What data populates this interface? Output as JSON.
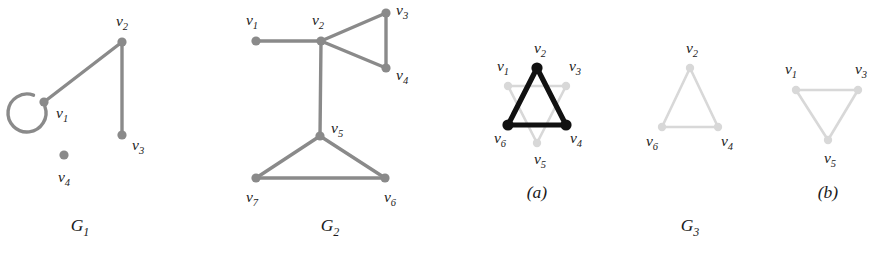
{
  "figure": {
    "width": 873,
    "height": 255,
    "background": "#ffffff",
    "colors": {
      "edge_gray": "#8a8a8a",
      "node_gray": "#8a8a8a",
      "edge_light": "#d8d8d8",
      "node_light": "#d8d8d8",
      "highlight_black": "#111111",
      "label_text": "#1a1a1a"
    }
  },
  "graphs": [
    {
      "id": "G1",
      "caption": "G",
      "caption_sub": "1",
      "caption_x": 80,
      "caption_y": 231,
      "vertices": [
        {
          "id": "v1",
          "name": "v",
          "sub": "1",
          "x": 44,
          "y": 102,
          "r": 4.6,
          "style": "gray",
          "label_x": 56,
          "label_y": 118,
          "label_anchor": "start"
        },
        {
          "id": "v2",
          "name": "v",
          "sub": "2",
          "x": 122,
          "y": 42,
          "r": 4.6,
          "style": "gray",
          "label_x": 122,
          "label_y": 26,
          "label_anchor": "middle"
        },
        {
          "id": "v3",
          "name": "v",
          "sub": "3",
          "x": 122,
          "y": 135,
          "r": 4.6,
          "style": "gray",
          "label_x": 132,
          "label_y": 150,
          "label_anchor": "start"
        },
        {
          "id": "v4",
          "name": "v",
          "sub": "4",
          "x": 64,
          "y": 155,
          "r": 4.6,
          "style": "gray",
          "label_x": 64,
          "label_y": 182,
          "label_anchor": "middle"
        }
      ],
      "edges": [
        {
          "from": "v1",
          "to": "v2",
          "style": "gray"
        },
        {
          "from": "v2",
          "to": "v3",
          "style": "gray"
        }
      ],
      "self_loops": [
        {
          "at": "v1",
          "cx": 27,
          "cy": 113,
          "r": 19,
          "style": "gray",
          "gap_start_deg": -70,
          "gap_end_deg": -20
        }
      ]
    },
    {
      "id": "G2",
      "caption": "G",
      "caption_sub": "2",
      "caption_x": 330,
      "caption_y": 231,
      "vertices": [
        {
          "id": "v1",
          "name": "v",
          "sub": "1",
          "x": 256,
          "y": 41,
          "r": 4.6,
          "style": "gray",
          "label_x": 252,
          "label_y": 25,
          "label_anchor": "middle"
        },
        {
          "id": "v2",
          "name": "v",
          "sub": "2",
          "x": 321,
          "y": 41,
          "r": 4.6,
          "style": "gray",
          "label_x": 318,
          "label_y": 25,
          "label_anchor": "middle"
        },
        {
          "id": "v3",
          "name": "v",
          "sub": "3",
          "x": 386,
          "y": 13,
          "r": 4.6,
          "style": "gray",
          "label_x": 396,
          "label_y": 15,
          "label_anchor": "start"
        },
        {
          "id": "v4",
          "name": "v",
          "sub": "4",
          "x": 386,
          "y": 68,
          "r": 4.6,
          "style": "gray",
          "label_x": 396,
          "label_y": 80,
          "label_anchor": "start"
        },
        {
          "id": "v5",
          "name": "v",
          "sub": "5",
          "x": 320,
          "y": 136,
          "r": 4.6,
          "style": "gray",
          "label_x": 331,
          "label_y": 133,
          "label_anchor": "start"
        },
        {
          "id": "v6",
          "name": "v",
          "sub": "6",
          "x": 385,
          "y": 178,
          "r": 4.6,
          "style": "gray",
          "label_x": 390,
          "label_y": 202,
          "label_anchor": "middle"
        },
        {
          "id": "v7",
          "name": "v",
          "sub": "7",
          "x": 256,
          "y": 178,
          "r": 4.6,
          "style": "gray",
          "label_x": 252,
          "label_y": 202,
          "label_anchor": "middle"
        }
      ],
      "edges": [
        {
          "from": "v1",
          "to": "v2",
          "style": "gray"
        },
        {
          "from": "v2",
          "to": "v3",
          "style": "gray"
        },
        {
          "from": "v2",
          "to": "v4",
          "style": "gray"
        },
        {
          "from": "v3",
          "to": "v4",
          "style": "gray"
        },
        {
          "from": "v2",
          "to": "v5",
          "style": "gray"
        },
        {
          "from": "v5",
          "to": "v6",
          "style": "gray"
        },
        {
          "from": "v5",
          "to": "v7",
          "style": "gray"
        },
        {
          "from": "v6",
          "to": "v7",
          "style": "gray"
        }
      ],
      "self_loops": []
    },
    {
      "id": "G3a",
      "caption": "(a)",
      "caption_sub": "",
      "caption_x": 537,
      "caption_y": 198,
      "vertices": [
        {
          "id": "v1",
          "name": "v",
          "sub": "1",
          "x": 508,
          "y": 86,
          "r": 4.2,
          "style": "light",
          "label_x": 503,
          "label_y": 71,
          "label_anchor": "middle"
        },
        {
          "id": "v2",
          "name": "v",
          "sub": "2",
          "x": 537,
          "y": 68,
          "r": 5.6,
          "style": "black",
          "label_x": 540,
          "label_y": 53,
          "label_anchor": "middle"
        },
        {
          "id": "v3",
          "name": "v",
          "sub": "3",
          "x": 566,
          "y": 86,
          "r": 4.2,
          "style": "light",
          "label_x": 575,
          "label_y": 71,
          "label_anchor": "middle"
        },
        {
          "id": "v4",
          "name": "v",
          "sub": "4",
          "x": 566,
          "y": 125,
          "r": 5.6,
          "style": "black",
          "label_x": 576,
          "label_y": 143,
          "label_anchor": "middle"
        },
        {
          "id": "v5",
          "name": "v",
          "sub": "5",
          "x": 537,
          "y": 143,
          "r": 4.2,
          "style": "light",
          "label_x": 540,
          "label_y": 164,
          "label_anchor": "middle"
        },
        {
          "id": "v6",
          "name": "v",
          "sub": "6",
          "x": 508,
          "y": 125,
          "r": 5.6,
          "style": "black",
          "label_x": 500,
          "label_y": 143,
          "label_anchor": "middle"
        }
      ],
      "edges": [
        {
          "from": "v1",
          "to": "v3",
          "style": "light"
        },
        {
          "from": "v3",
          "to": "v5",
          "style": "light"
        },
        {
          "from": "v5",
          "to": "v1",
          "style": "light"
        },
        {
          "from": "v2",
          "to": "v4",
          "style": "black"
        },
        {
          "from": "v4",
          "to": "v6",
          "style": "black"
        },
        {
          "from": "v6",
          "to": "v2",
          "style": "black"
        }
      ],
      "self_loops": []
    },
    {
      "id": "G3mid",
      "caption": "",
      "caption_sub": "",
      "caption_x": 0,
      "caption_y": 0,
      "vertices": [
        {
          "id": "v2",
          "name": "v",
          "sub": "2",
          "x": 690,
          "y": 68,
          "r": 4.2,
          "style": "light",
          "label_x": 692,
          "label_y": 53,
          "label_anchor": "middle"
        },
        {
          "id": "v4",
          "name": "v",
          "sub": "4",
          "x": 718,
          "y": 127,
          "r": 4.2,
          "style": "light",
          "label_x": 727,
          "label_y": 146,
          "label_anchor": "middle"
        },
        {
          "id": "v6",
          "name": "v",
          "sub": "6",
          "x": 662,
          "y": 127,
          "r": 4.2,
          "style": "light",
          "label_x": 652,
          "label_y": 146,
          "label_anchor": "middle"
        }
      ],
      "edges": [
        {
          "from": "v2",
          "to": "v4",
          "style": "light"
        },
        {
          "from": "v4",
          "to": "v6",
          "style": "light"
        },
        {
          "from": "v6",
          "to": "v2",
          "style": "light"
        }
      ],
      "self_loops": []
    },
    {
      "id": "G3b",
      "caption": "(b)",
      "caption_sub": "",
      "caption_x": 828,
      "caption_y": 198,
      "vertices": [
        {
          "id": "v1",
          "name": "v",
          "sub": "1",
          "x": 796,
          "y": 90,
          "r": 4.2,
          "style": "light",
          "label_x": 791,
          "label_y": 74,
          "label_anchor": "middle"
        },
        {
          "id": "v3",
          "name": "v",
          "sub": "3",
          "x": 858,
          "y": 90,
          "r": 4.2,
          "style": "light",
          "label_x": 861,
          "label_y": 74,
          "label_anchor": "middle"
        },
        {
          "id": "v5",
          "name": "v",
          "sub": "5",
          "x": 828,
          "y": 140,
          "r": 4.2,
          "style": "light",
          "label_x": 830,
          "label_y": 163,
          "label_anchor": "middle"
        }
      ],
      "edges": [
        {
          "from": "v1",
          "to": "v3",
          "style": "light"
        },
        {
          "from": "v3",
          "to": "v5",
          "style": "light"
        },
        {
          "from": "v5",
          "to": "v1",
          "style": "light"
        }
      ],
      "self_loops": []
    }
  ],
  "group_captions": [
    {
      "id": "G3",
      "text": "G",
      "sub": "3",
      "x": 690,
      "y": 231
    }
  ]
}
